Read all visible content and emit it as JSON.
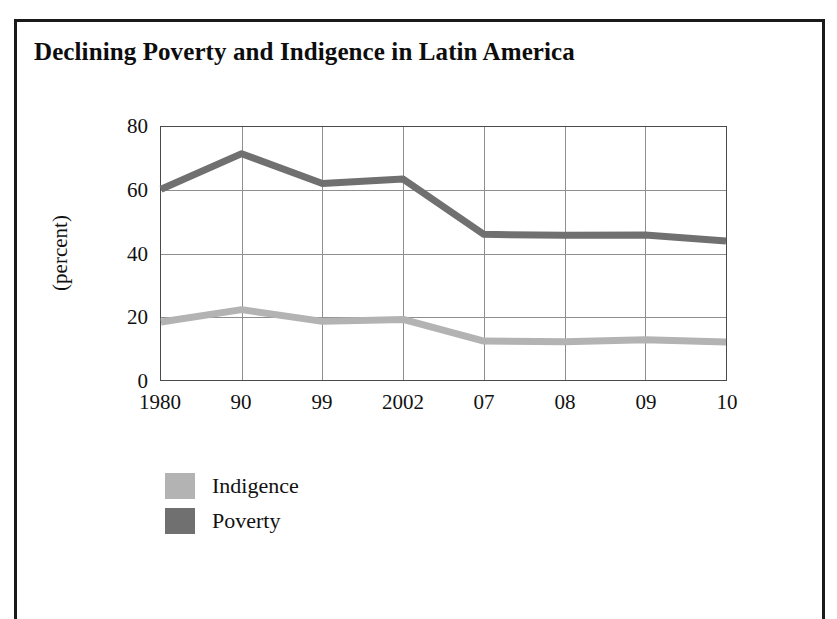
{
  "figure": {
    "title": "Declining Poverty and Indigence in Latin America",
    "frame_color": "#1a1a1a",
    "background": "#ffffff"
  },
  "chart_data": {
    "type": "line",
    "title": "Declining Poverty and Indigence in Latin America",
    "subtitle": "",
    "xlabel": "",
    "ylabel": "(percent)",
    "categories": [
      "1980",
      "90",
      "99",
      "2002",
      "07",
      "08",
      "09",
      "10"
    ],
    "ylim": [
      0,
      80
    ],
    "yticks": [
      0,
      20,
      40,
      60,
      80
    ],
    "grid": true,
    "legend_position": "below-left",
    "series": [
      {
        "name": "Indigence",
        "color": "#b3b3b3",
        "values": [
          18.6,
          22.5,
          18.8,
          19.4,
          12.6,
          12.4,
          13.0,
          12.3
        ]
      },
      {
        "name": "Poverty",
        "color": "#707070",
        "values": [
          60.4,
          71.6,
          62.2,
          63.6,
          46.2,
          45.9,
          46.0,
          44.1
        ]
      }
    ],
    "annotations": []
  },
  "axes": {
    "y_tick_labels": [
      "80",
      "60",
      "40",
      "20",
      "0"
    ],
    "y_axis_title": "(percent)",
    "x_tick_labels": [
      "1980",
      "90",
      "99",
      "2002",
      "07",
      "08",
      "09",
      "10"
    ]
  },
  "legend": {
    "items": [
      {
        "label": "Indigence",
        "color": "#b3b3b3"
      },
      {
        "label": "Poverty",
        "color": "#707070"
      }
    ]
  }
}
